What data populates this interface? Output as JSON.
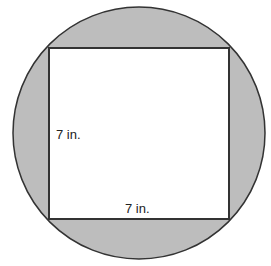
{
  "diagram": {
    "colors": {
      "shaded": "#bdbdbd",
      "stroke": "#333333",
      "square_fill": "#ffffff"
    },
    "labels": {
      "side_left": "7 in.",
      "side_bottom": "7 in."
    }
  }
}
